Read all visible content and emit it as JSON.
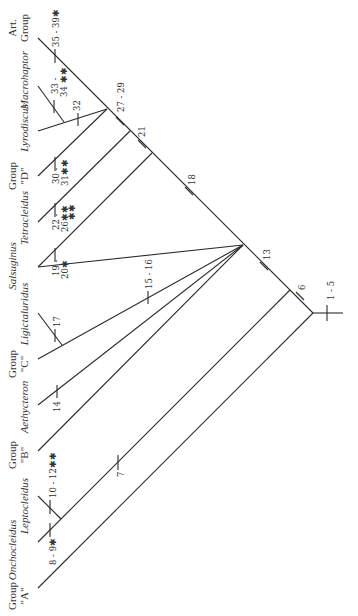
{
  "diagram": {
    "type": "cladogram",
    "orientation": "rotated-90-ccw",
    "taxa": [
      {
        "id": "groupA",
        "label_line1": "Group",
        "label_line2": "\"A\"",
        "italic": false
      },
      {
        "id": "onchocleidus",
        "label": "Onchocleidus",
        "italic": true
      },
      {
        "id": "leptocleidus",
        "label": "Leptocleidus",
        "italic": true
      },
      {
        "id": "groupB",
        "label_line1": "Group",
        "label_line2": "\"B\"",
        "italic": false
      },
      {
        "id": "aethycteron",
        "label": "Aethycteron",
        "italic": true
      },
      {
        "id": "groupC",
        "label_line1": "Group",
        "label_line2": "\"C\"",
        "italic": false
      },
      {
        "id": "ligictaluridus",
        "label": "Ligictaluridus",
        "italic": true
      },
      {
        "id": "salsuginus",
        "label": "Salsuginus",
        "italic": true
      },
      {
        "id": "tetracleidus",
        "label": "Tetracleidus",
        "italic": true
      },
      {
        "id": "groupD",
        "label_line1": "Group",
        "label_line2": "\"D\"",
        "italic": false
      },
      {
        "id": "lyrodiscus",
        "label": "Lyrodiscus",
        "italic": true
      },
      {
        "id": "macrohaptor",
        "label": "Macrohaptor",
        "italic": true
      },
      {
        "id": "artGroup",
        "label_line1": "Art.",
        "label_line2": "Group",
        "italic": false
      }
    ],
    "characters": {
      "c1_5": "1 - 5",
      "c6": "6",
      "c7": "7",
      "c8_9": "8 - 9✱",
      "c10_12": "10 - 12✱✱",
      "c13": "13",
      "c14": "14",
      "c15_16": "15 - 16",
      "c17": "17",
      "c18": "18",
      "c19_20a": "19 -",
      "c19_20b": "20✱",
      "c21": "21",
      "c22_26a": "22 -",
      "c22_26b": "26✱✱",
      "c22_26c": "✱✱",
      "c27_29": "27 - 29",
      "c30_31a": "30 -",
      "c30_31b": "31✱✱",
      "c32": "32",
      "c33_34a": "33 -",
      "c33_34b": "34 ✱✱",
      "c35_39": "35 - 39✱"
    },
    "colors": {
      "line": "#2a2a2a",
      "text": "#333333",
      "background": "#ffffff"
    }
  }
}
